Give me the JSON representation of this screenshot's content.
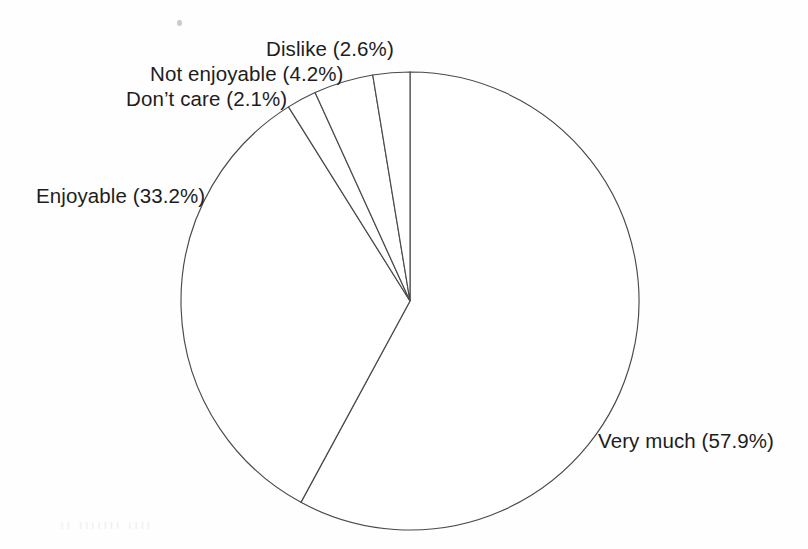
{
  "figure": {
    "background_color": "#fefefe",
    "line_color": "#4a4a4a",
    "text_color": "#1d1d1d",
    "artifact_ghost_text": "ıı ııııııı ıııı"
  },
  "chart_data": {
    "type": "pie",
    "title": "",
    "subtitle": "",
    "xlabel": "",
    "ylabel": "",
    "grid": false,
    "legend_position": "none",
    "label_format": "{name} ({value}%)",
    "start_angle_deg": 0,
    "direction": "clockwise",
    "center_px": [
      410,
      301
    ],
    "radius_px": 229,
    "categories": [
      "Very much",
      "Enjoyable",
      "Don’t care",
      "Not enjoyable",
      "Dislike"
    ],
    "values": [
      57.9,
      33.2,
      2.1,
      4.2,
      2.6
    ],
    "slices": [
      {
        "name": "Very much",
        "value": 57.9,
        "label": "Very much (57.9%)",
        "start_angle_deg": 0,
        "end_angle_deg": 208.44,
        "fill": "#ffffff",
        "stroke": "#4a4a4a"
      },
      {
        "name": "Enjoyable",
        "value": 33.2,
        "label": "Enjoyable (33.2%)",
        "start_angle_deg": 208.44,
        "end_angle_deg": 327.96,
        "fill": "#ffffff",
        "stroke": "#4a4a4a"
      },
      {
        "name": "Don’t care",
        "value": 2.1,
        "label": "Don’t care (2.1%)",
        "start_angle_deg": 327.96,
        "end_angle_deg": 335.52,
        "fill": "#ffffff",
        "stroke": "#4a4a4a"
      },
      {
        "name": "Not enjoyable",
        "value": 4.2,
        "label": "Not enjoyable (4.2%)",
        "start_angle_deg": 335.52,
        "end_angle_deg": 350.64,
        "fill": "#ffffff",
        "stroke": "#4a4a4a"
      },
      {
        "name": "Dislike",
        "value": 2.6,
        "label": "Dislike (2.6%)",
        "start_angle_deg": 350.64,
        "end_angle_deg": 360,
        "fill": "#ffffff",
        "stroke": "#4a4a4a"
      }
    ]
  }
}
